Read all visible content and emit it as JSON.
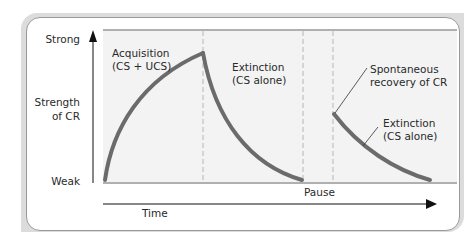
{
  "diagram": {
    "y_axis": {
      "label_line1": "Strength",
      "label_line2": "of CR",
      "top_label": "Strong",
      "bottom_label": "Weak"
    },
    "x_axis": {
      "label": "Time"
    },
    "phases": [
      {
        "line1": "Acquisition",
        "line2": "(CS + UCS)"
      },
      {
        "line1": "Extinction",
        "line2": "(CS alone)"
      },
      {
        "line1": "Spontaneous",
        "line2": "recovery of CR"
      },
      {
        "line1": "Extinction",
        "line2": "(CS alone)"
      }
    ],
    "pause_label": "Pause",
    "colors": {
      "curve": "#6b6b6b",
      "plot_bg": "#f2f2f2",
      "guide": "#b5b5b5",
      "frame": "#9a9a9a"
    },
    "curve_data": {
      "acquisition": {
        "start_strength": 0.02,
        "end_strength": 0.85
      },
      "extinction_1": {
        "start_strength": 0.85,
        "end_strength": 0.02
      },
      "spontaneous_recovery_peak": 0.45,
      "extinction_2": {
        "start_strength": 0.45,
        "end_strength": 0.02
      }
    }
  }
}
